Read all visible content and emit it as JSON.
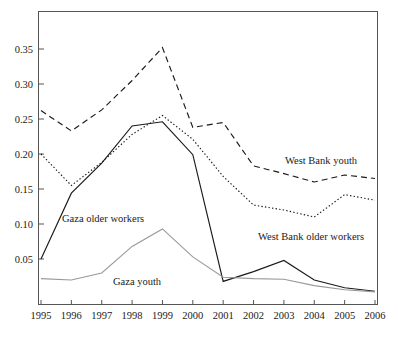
{
  "chart_data": {
    "type": "line",
    "title": "",
    "xlabel": "",
    "ylabel": "",
    "categories": [
      "1995",
      "1996",
      "1997",
      "1998",
      "1999",
      "2000",
      "2001",
      "2002",
      "2003",
      "2004",
      "2005",
      "2006"
    ],
    "x": [
      1995,
      1996,
      1997,
      1998,
      1999,
      2000,
      2001,
      2002,
      2003,
      2004,
      2005,
      2006
    ],
    "xlim": [
      1995,
      2006
    ],
    "ylim": [
      0,
      0.39
    ],
    "ytick_labels": [
      "0.05",
      "0.10",
      "0.15",
      "0.20",
      "0.25",
      "0.30",
      "0.35"
    ],
    "yticks": [
      0.05,
      0.1,
      0.15,
      0.2,
      0.25,
      0.3,
      0.35
    ],
    "grid": false,
    "legend_position": "inline-annotations",
    "series": [
      {
        "name": "West Bank youth",
        "style": "dashed",
        "color": "#1a1a1a",
        "values": [
          0.262,
          0.233,
          0.263,
          0.305,
          0.352,
          0.238,
          0.245,
          0.183,
          0.172,
          0.16,
          0.17,
          0.165
        ]
      },
      {
        "name": "West Bank older workers",
        "style": "dotted",
        "color": "#1a1a1a",
        "values": [
          0.2,
          0.155,
          0.188,
          0.228,
          0.255,
          0.221,
          0.168,
          0.127,
          0.12,
          0.11,
          0.142,
          0.134
        ]
      },
      {
        "name": "Gaza older workers",
        "style": "solid",
        "color": "#1a1a1a",
        "values": [
          0.05,
          0.144,
          0.187,
          0.24,
          0.246,
          0.199,
          0.018,
          0.032,
          0.048,
          0.02,
          0.009,
          0.004
        ]
      },
      {
        "name": "Gaza youth",
        "style": "solid-light",
        "color": "#999999",
        "values": [
          0.022,
          0.02,
          0.03,
          0.068,
          0.093,
          0.053,
          0.024,
          0.022,
          0.021,
          0.012,
          0.006,
          0.003
        ]
      }
    ],
    "annotations": [
      {
        "text": "West Bank youth",
        "x": 285,
        "y": 164
      },
      {
        "text": "West Bank older workers",
        "x": 258,
        "y": 240
      },
      {
        "text": "Gaza older workers",
        "x": 62,
        "y": 222
      },
      {
        "text": "Gaza youth",
        "x": 113,
        "y": 285
      }
    ]
  }
}
